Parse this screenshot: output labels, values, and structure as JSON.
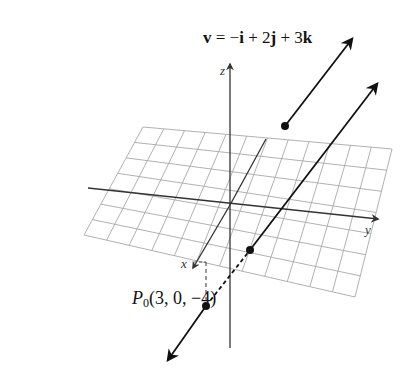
{
  "figure": {
    "type": "3d-line-in-space",
    "vector_label": {
      "name": "v",
      "equals": "=",
      "terms": [
        "−",
        "i",
        " + 2",
        "j",
        " + 3",
        "k"
      ],
      "full_text": "v = −i + 2j + 3k"
    },
    "point_label": {
      "name": "P",
      "subscript": "0",
      "coords": "(3, 0, −4)",
      "full_text": "P0(3, 0, −4)"
    },
    "axes": {
      "x": "x",
      "y": "y",
      "z": "z"
    },
    "colors": {
      "line": "#111111",
      "grid": "#9a9a9a",
      "axis": "#333333",
      "background": "#ffffff"
    }
  }
}
